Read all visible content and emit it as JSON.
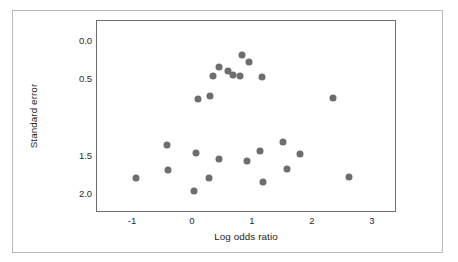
{
  "figure": {
    "kind": "funnel-plot",
    "dot_color": "#6d6d70",
    "frame_color": "#6e6e6e",
    "outer_border_color": "#b9b9b9",
    "background": "#ffffff"
  },
  "chart_data": {
    "type": "scatter",
    "title": "",
    "subtitle": "",
    "xlabel": "Log odds ratio",
    "ylabel": "Standard error",
    "xlim": [
      -1.6,
      3.4
    ],
    "ylim": [
      -0.28,
      2.24
    ],
    "y_inverted": true,
    "grid": false,
    "legend": null,
    "legend_position": "none",
    "xticks": [
      -1,
      0,
      1,
      2,
      3
    ],
    "xticklabels": [
      "-1",
      "0",
      "1",
      "2",
      "3"
    ],
    "yticks": [
      0.0,
      0.5,
      1.5,
      2.0
    ],
    "yticklabels": [
      "0.0",
      "0.5",
      "1.5",
      "2.0"
    ],
    "marker": "circle",
    "marker_size_px": 7,
    "n_points": 25,
    "series": [
      {
        "name": "studies",
        "x": [
          0.82,
          0.94,
          0.43,
          0.58,
          0.33,
          0.66,
          0.78,
          1.15,
          0.08,
          0.29,
          2.33,
          -0.43,
          1.5,
          0.05,
          1.12,
          1.79,
          0.43,
          0.9,
          1.57,
          -0.42,
          0.27,
          2.6,
          1.17,
          0.02,
          -0.95
        ],
        "y": [
          0.17,
          0.26,
          0.33,
          0.37,
          0.44,
          0.43,
          0.44,
          0.46,
          0.74,
          0.7,
          0.73,
          1.35,
          1.31,
          1.45,
          1.43,
          1.47,
          1.53,
          1.56,
          1.66,
          1.68,
          1.78,
          1.77,
          1.83,
          1.95,
          1.78
        ]
      }
    ]
  },
  "points": [
    {
      "x": 0.82,
      "y": 0.17
    },
    {
      "x": 0.94,
      "y": 0.26
    },
    {
      "x": 0.43,
      "y": 0.33
    },
    {
      "x": 0.58,
      "y": 0.37
    },
    {
      "x": 0.33,
      "y": 0.44
    },
    {
      "x": 0.66,
      "y": 0.43
    },
    {
      "x": 0.78,
      "y": 0.44
    },
    {
      "x": 1.15,
      "y": 0.46
    },
    {
      "x": 0.08,
      "y": 0.74
    },
    {
      "x": 0.29,
      "y": 0.7
    },
    {
      "x": 2.33,
      "y": 0.73
    },
    {
      "x": -0.43,
      "y": 1.35
    },
    {
      "x": 1.5,
      "y": 1.31
    },
    {
      "x": 0.05,
      "y": 1.45
    },
    {
      "x": 1.12,
      "y": 1.43
    },
    {
      "x": 1.79,
      "y": 1.47
    },
    {
      "x": 0.43,
      "y": 1.53
    },
    {
      "x": 0.9,
      "y": 1.56
    },
    {
      "x": 1.57,
      "y": 1.66
    },
    {
      "x": -0.42,
      "y": 1.68
    },
    {
      "x": 0.27,
      "y": 1.78
    },
    {
      "x": 2.6,
      "y": 1.77
    },
    {
      "x": 1.17,
      "y": 1.83
    },
    {
      "x": 0.02,
      "y": 1.95
    },
    {
      "x": -0.95,
      "y": 1.78
    }
  ]
}
